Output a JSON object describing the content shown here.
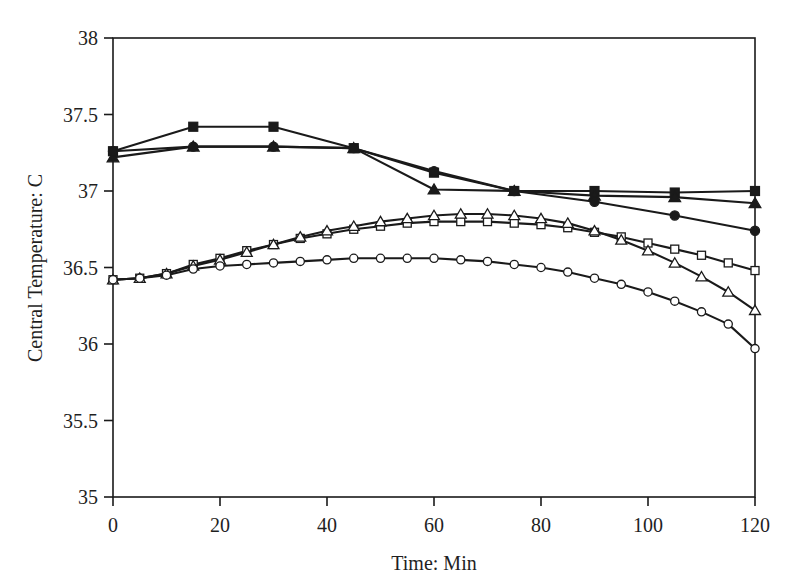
{
  "chart_data": {
    "type": "line",
    "title": "",
    "subtitle": "",
    "xlabel": "Time: Min",
    "ylabel": "Central Temperature: C",
    "xlim": [
      0,
      120
    ],
    "ylim": [
      35,
      38
    ],
    "xticks": [
      0,
      20,
      40,
      60,
      80,
      100,
      120
    ],
    "yticks": [
      35,
      35.5,
      36,
      36.5,
      37,
      37.5,
      38
    ],
    "xtick_labels": [
      "0",
      "20",
      "40",
      "60",
      "80",
      "100",
      "120"
    ],
    "ytick_labels": [
      "35",
      "35.5",
      "36",
      "36.5",
      "37",
      "37.5",
      "38"
    ],
    "grid": false,
    "legend": "none",
    "series": [
      {
        "name": "filled-square",
        "marker": "filled-square",
        "x": [
          0,
          15,
          30,
          45,
          60,
          75,
          90,
          105,
          120
        ],
        "values": [
          37.26,
          37.42,
          37.42,
          37.28,
          37.12,
          37.0,
          37.0,
          36.99,
          37.0
        ]
      },
      {
        "name": "filled-triangle",
        "marker": "filled-triangle",
        "x": [
          0,
          15,
          30,
          45,
          60,
          75,
          90,
          105,
          120
        ],
        "values": [
          37.22,
          37.29,
          37.29,
          37.28,
          37.01,
          37.0,
          36.97,
          36.96,
          36.92
        ]
      },
      {
        "name": "filled-circle",
        "marker": "filled-circle",
        "x": [
          0,
          15,
          30,
          45,
          60,
          75,
          90,
          105,
          120
        ],
        "values": [
          37.26,
          37.29,
          37.29,
          37.28,
          37.13,
          37.0,
          36.93,
          36.84,
          36.74
        ]
      },
      {
        "name": "open-square",
        "marker": "open-square",
        "x": [
          0,
          5,
          10,
          15,
          20,
          25,
          30,
          35,
          40,
          45,
          50,
          55,
          60,
          65,
          70,
          75,
          80,
          85,
          90,
          95,
          100,
          105,
          110,
          115,
          120
        ],
        "values": [
          36.42,
          36.43,
          36.46,
          36.52,
          36.56,
          36.61,
          36.65,
          36.69,
          36.72,
          36.75,
          36.77,
          36.79,
          36.8,
          36.8,
          36.8,
          36.79,
          36.78,
          36.76,
          36.73,
          36.7,
          36.66,
          36.62,
          36.58,
          36.53,
          36.48
        ]
      },
      {
        "name": "open-triangle",
        "marker": "open-triangle",
        "x": [
          0,
          5,
          10,
          15,
          20,
          25,
          30,
          35,
          40,
          45,
          50,
          55,
          60,
          65,
          70,
          75,
          80,
          85,
          90,
          95,
          100,
          105,
          110,
          115,
          120
        ],
        "values": [
          36.42,
          36.43,
          36.46,
          36.51,
          36.55,
          36.6,
          36.65,
          36.7,
          36.74,
          36.77,
          36.8,
          36.82,
          36.84,
          36.85,
          36.85,
          36.84,
          36.82,
          36.79,
          36.74,
          36.68,
          36.61,
          36.53,
          36.44,
          36.34,
          36.22
        ]
      },
      {
        "name": "open-circle",
        "marker": "open-circle",
        "x": [
          0,
          5,
          10,
          15,
          20,
          25,
          30,
          35,
          40,
          45,
          50,
          55,
          60,
          65,
          70,
          75,
          80,
          85,
          90,
          95,
          100,
          105,
          110,
          115,
          120
        ],
        "values": [
          36.42,
          36.43,
          36.45,
          36.49,
          36.51,
          36.52,
          36.53,
          36.54,
          36.55,
          36.56,
          36.56,
          36.56,
          36.56,
          36.55,
          36.54,
          36.52,
          36.5,
          36.47,
          36.43,
          36.39,
          36.34,
          36.28,
          36.21,
          36.13,
          35.97
        ]
      }
    ],
    "colors": {
      "line": "#1a1a1a",
      "marker_fill": "#1a1a1a",
      "marker_open_fill": "#ffffff",
      "axis": "#1a1a1a",
      "background": "#ffffff"
    }
  }
}
